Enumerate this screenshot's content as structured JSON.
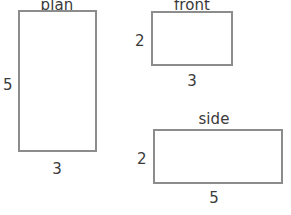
{
  "figure": {
    "type": "orthographic-projection-drawing",
    "background_color": "#ffffff",
    "stroke_color": "#8c8c8c",
    "text_color": "#3a3a3a",
    "views": [
      {
        "id": "plan",
        "title": "plan",
        "title_clipped_top": true,
        "width_label": "3",
        "height_label": "5",
        "rect": {
          "x": 18,
          "y": 10,
          "w": 79,
          "h": 142
        },
        "title_pos": {
          "x": 57,
          "y": 1
        },
        "height_label_pos": {
          "x": 9,
          "y": 85
        },
        "width_label_pos": {
          "x": 57,
          "y": 169
        }
      },
      {
        "id": "front",
        "title": "front",
        "title_clipped_top": true,
        "width_label": "3",
        "height_label": "2",
        "rect": {
          "x": 151,
          "y": 11,
          "w": 82,
          "h": 55
        },
        "title_pos": {
          "x": 192,
          "y": 1
        },
        "height_label_pos": {
          "x": 140,
          "y": 41
        },
        "width_label_pos": {
          "x": 192,
          "y": 81
        }
      },
      {
        "id": "side",
        "title": "side",
        "title_clipped_top": false,
        "width_label": "5",
        "height_label": "2",
        "rect": {
          "x": 153,
          "y": 129,
          "w": 130,
          "h": 55
        },
        "title_pos": {
          "x": 214,
          "y": 112
        },
        "height_label_pos": {
          "x": 142,
          "y": 159
        },
        "width_label_pos": {
          "x": 214,
          "y": 198
        }
      }
    ]
  }
}
